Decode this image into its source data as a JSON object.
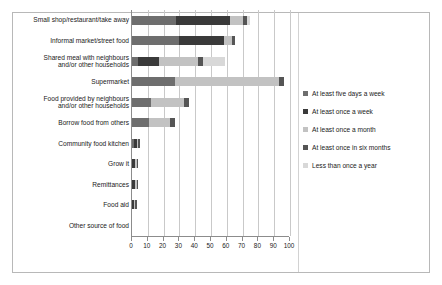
{
  "chart_data": {
    "type": "bar",
    "orientation": "horizontal",
    "stacked": true,
    "title": "",
    "xlabel": "",
    "ylabel": "",
    "xlim": [
      0,
      100
    ],
    "xticks": [
      0,
      10,
      20,
      30,
      40,
      50,
      60,
      70,
      80,
      90,
      100
    ],
    "grid": true,
    "legend_position": "right",
    "categories": [
      "Small shop/restaurant/take away",
      "Informal market/street food",
      "Shared meal with neighbours\nand/or other households",
      "Supermarket",
      "Food provided by neighbours\nand/or other households",
      "Borrow food from others",
      "Community food kitchen",
      "Grow it",
      "Remittances",
      "Food aid",
      "Other source of food"
    ],
    "series": [
      {
        "name": "At least five days a week",
        "color": "#6e6e6e",
        "values": [
          28,
          30,
          4,
          27,
          12,
          11,
          1,
          0,
          0,
          0,
          0
        ]
      },
      {
        "name": "At least once a week",
        "color": "#3a3a3a",
        "values": [
          34,
          28,
          13,
          0,
          0,
          0,
          2,
          2,
          2,
          1,
          0
        ]
      },
      {
        "name": "At least once a month",
        "color": "#c2c2c2",
        "values": [
          8,
          5,
          25,
          66,
          21,
          13,
          1,
          1,
          1,
          1,
          0
        ]
      },
      {
        "name": "At least once in six months",
        "color": "#555555",
        "values": [
          3,
          2,
          3,
          3,
          3,
          3,
          1,
          1,
          1,
          1,
          0
        ]
      },
      {
        "name": "Less than once a year",
        "color": "#d8d8d8",
        "values": [
          2,
          0,
          14,
          0,
          0,
          0,
          0,
          0,
          0,
          0,
          0
        ]
      }
    ],
    "totals": [
      75,
      65,
      59,
      96,
      36,
      27,
      5,
      4,
      4,
      3,
      0
    ]
  },
  "axis": {
    "tick_labels": [
      "0",
      "10",
      "20",
      "30",
      "40",
      "50",
      "60",
      "70",
      "80",
      "90",
      "100"
    ]
  },
  "legend": {
    "items": [
      {
        "label": "At least five days a week",
        "color": "#6e6e6e"
      },
      {
        "label": "At least once a week",
        "color": "#3a3a3a"
      },
      {
        "label": "At least once a month",
        "color": "#c2c2c2"
      },
      {
        "label": "At least once in six months",
        "color": "#555555"
      },
      {
        "label": "Less than once a year",
        "color": "#d8d8d8"
      }
    ]
  }
}
